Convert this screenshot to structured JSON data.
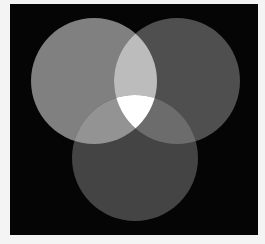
{
  "diagram": {
    "type": "venn",
    "sets": 3,
    "background": "#050505",
    "page_background": "#f4f4f4",
    "circles": [
      {
        "id": "left",
        "cx": 84,
        "cy": 77,
        "r": 63,
        "fill": "#808080"
      },
      {
        "id": "right",
        "cx": 167,
        "cy": 77,
        "r": 63,
        "fill": "#4f4f4f"
      },
      {
        "id": "bottom",
        "cx": 125,
        "cy": 154,
        "r": 63,
        "fill": "#444444"
      }
    ],
    "regions": {
      "left_right": "#bcbcbc",
      "left_bottom": "#939393",
      "right_bottom": "#6c6c6c",
      "all_three": "#ffffff"
    }
  }
}
